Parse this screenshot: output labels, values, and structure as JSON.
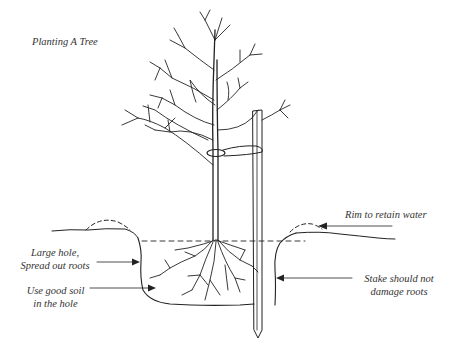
{
  "diagram": {
    "title": "Planting A Tree",
    "labels": {
      "large_hole": {
        "line1": "Large hole,",
        "line2": "Spread out roots"
      },
      "good_soil": {
        "line1": "Use good soil",
        "line2": "in the hole"
      },
      "rim": {
        "line1": "Rim to retain water"
      },
      "stake": {
        "line1": "Stake should not",
        "line2": "damage roots"
      }
    },
    "elements": [
      "tree",
      "trunk-tie",
      "stake",
      "planting-hole",
      "root-ball",
      "water-level-line",
      "soil-rim-left",
      "soil-rim-right",
      "ground-line"
    ],
    "colors": {
      "ink": "#222222",
      "text": "#333333",
      "background": "#ffffff"
    }
  }
}
